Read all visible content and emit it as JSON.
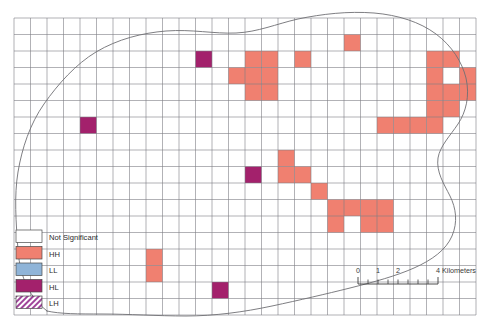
{
  "figure": {
    "kind": "choropleth-cluster-map",
    "width": 492,
    "height": 322,
    "background": "#ffffff"
  },
  "grid": {
    "x0": 14,
    "y0": 18,
    "cell": 16.5,
    "cols": 28,
    "rows": 18,
    "line_color": "#7d7d85",
    "line_width": 0.6,
    "fill": "#ffffff"
  },
  "boundary": {
    "name": "study-area-outline",
    "stroke": "#6f6f74",
    "stroke_width": 0.9,
    "fill": "none",
    "path": "M 47 311 C 30 298 20 278 18 250 C 16 222 14 196 18 172 C 22 148 30 124 44 104 C 58 84 76 64 96 52 C 118 39 142 33 166 31 C 192 29 214 34 236 33 C 258 32 276 24 298 19 C 322 14 348 11 374 13 C 398 15 420 22 436 34 C 452 46 462 62 466 78 C 470 96 466 112 458 124 C 450 136 440 146 438 158 C 436 172 444 184 450 196 C 456 208 458 222 452 236 C 446 250 432 260 414 268 C 396 276 374 282 350 288 C 326 294 300 300 272 306 C 244 312 214 316 186 316 C 158 316 128 314 102 314 C 78 314 60 314 47 311 Z"
  },
  "legend": {
    "name": "lisa-legend",
    "x": 16,
    "y": 230,
    "swatch_w": 26,
    "swatch_h": 12.5,
    "row_h": 16.5,
    "items": [
      {
        "label": "Not Significant",
        "color": "#ffffff",
        "pattern": "solid"
      },
      {
        "label": "HH",
        "color": "#f08070",
        "pattern": "solid"
      },
      {
        "label": "LL",
        "color": "#8fb4d8",
        "pattern": "solid"
      },
      {
        "label": "HL",
        "color": "#a3216c",
        "pattern": "solid"
      },
      {
        "label": "LH",
        "color": "#a0449a",
        "pattern": "hatch-diagonal"
      }
    ]
  },
  "scalebar": {
    "name": "scale-bar",
    "x": 358,
    "y": 278,
    "length": 80,
    "tick_labels": [
      "0",
      "1",
      "2",
      "4"
    ],
    "tick_positions": [
      0,
      20,
      40,
      80
    ],
    "units_label": "4 Kilometers",
    "units_text": "Kilometers",
    "minor_ticks": 8,
    "color": "#3a3a3a"
  },
  "cells": {
    "colors": {
      "HH": "#f08070",
      "HL": "#a3216c",
      "LL": "#8fb4d8",
      "LH": "#a0449a",
      "NS": "#ffffff"
    },
    "items": [
      {
        "col": 20,
        "row": 1,
        "class": "HH"
      },
      {
        "col": 11,
        "row": 2,
        "class": "HL"
      },
      {
        "col": 14,
        "row": 2,
        "class": "HH"
      },
      {
        "col": 15,
        "row": 2,
        "class": "HH"
      },
      {
        "col": 17,
        "row": 2,
        "class": "HH"
      },
      {
        "col": 25,
        "row": 2,
        "class": "HH"
      },
      {
        "col": 26,
        "row": 2,
        "class": "HH"
      },
      {
        "col": 13,
        "row": 3,
        "class": "HH"
      },
      {
        "col": 14,
        "row": 3,
        "class": "HH"
      },
      {
        "col": 15,
        "row": 3,
        "class": "HH"
      },
      {
        "col": 25,
        "row": 3,
        "class": "HH"
      },
      {
        "col": 27,
        "row": 3,
        "class": "HH"
      },
      {
        "col": 14,
        "row": 4,
        "class": "HH"
      },
      {
        "col": 15,
        "row": 4,
        "class": "HH"
      },
      {
        "col": 25,
        "row": 4,
        "class": "HH"
      },
      {
        "col": 26,
        "row": 4,
        "class": "HH"
      },
      {
        "col": 27,
        "row": 4,
        "class": "HH"
      },
      {
        "col": 25,
        "row": 5,
        "class": "HH"
      },
      {
        "col": 26,
        "row": 5,
        "class": "HH"
      },
      {
        "col": 4,
        "row": 6,
        "class": "HL"
      },
      {
        "col": 22,
        "row": 6,
        "class": "HH"
      },
      {
        "col": 23,
        "row": 6,
        "class": "HH"
      },
      {
        "col": 24,
        "row": 6,
        "class": "HH"
      },
      {
        "col": 25,
        "row": 6,
        "class": "HH"
      },
      {
        "col": 16,
        "row": 8,
        "class": "HH"
      },
      {
        "col": 14,
        "row": 9,
        "class": "HL"
      },
      {
        "col": 16,
        "row": 9,
        "class": "HH"
      },
      {
        "col": 17,
        "row": 9,
        "class": "HH"
      },
      {
        "col": 18,
        "row": 10,
        "class": "HH"
      },
      {
        "col": 19,
        "row": 11,
        "class": "HH"
      },
      {
        "col": 20,
        "row": 11,
        "class": "HH"
      },
      {
        "col": 21,
        "row": 11,
        "class": "HH"
      },
      {
        "col": 22,
        "row": 11,
        "class": "HH"
      },
      {
        "col": 19,
        "row": 12,
        "class": "HH"
      },
      {
        "col": 21,
        "row": 12,
        "class": "HH"
      },
      {
        "col": 22,
        "row": 12,
        "class": "HH"
      },
      {
        "col": 8,
        "row": 14,
        "class": "HH"
      },
      {
        "col": 8,
        "row": 15,
        "class": "HH"
      },
      {
        "col": 12,
        "row": 16,
        "class": "HL"
      }
    ]
  }
}
